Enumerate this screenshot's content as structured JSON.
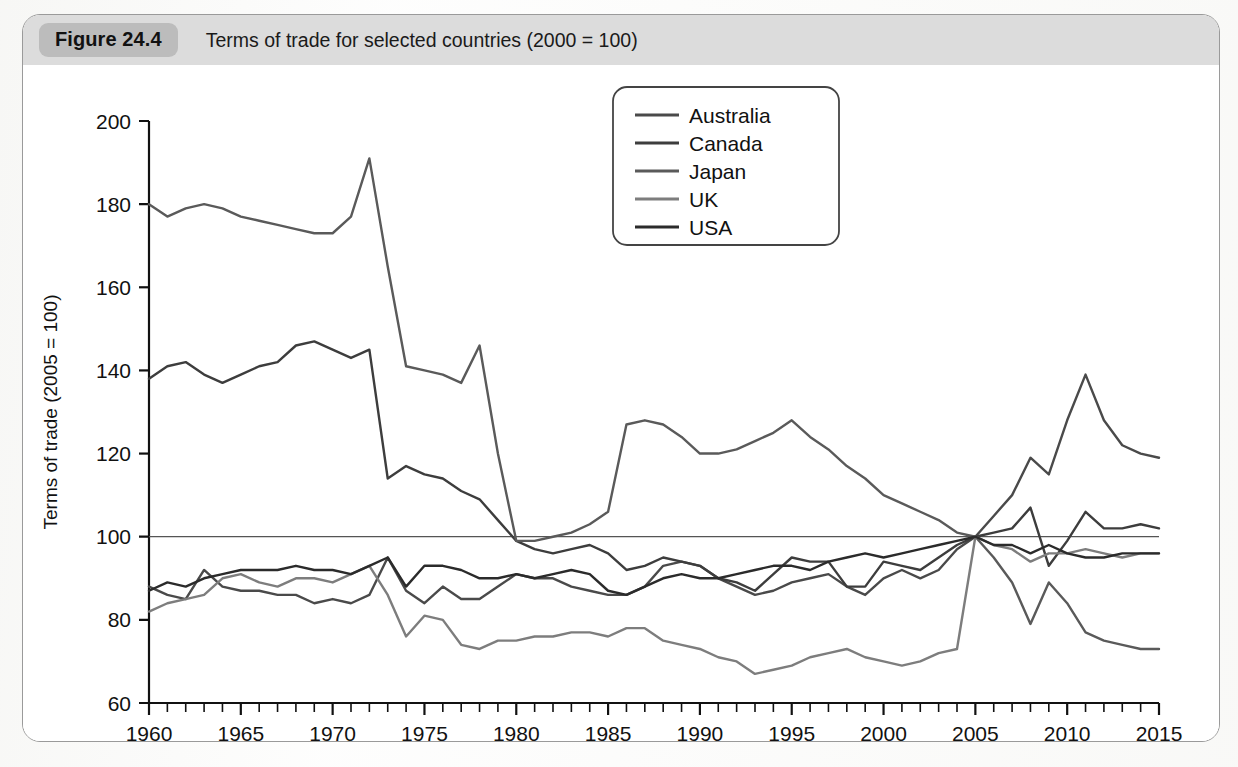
{
  "figure": {
    "badge_label": "Figure 24.4",
    "caption": "Terms of trade for selected countries (2000 = 100)",
    "footnote": ""
  },
  "colors": {
    "header_band": "#dcdcdc",
    "badge": "#bcbcbc",
    "frame_border": "#9a9a9a",
    "axis": "#111111",
    "series_australia": "#4a4a4a",
    "series_canada": "#3d3d3d",
    "series_japan": "#5a5a5a",
    "series_uk": "#7d7d7d",
    "series_usa": "#2b2b2b",
    "reference_line": "#555555"
  },
  "chart_data": {
    "type": "line",
    "title": "Terms of trade for selected countries (2000 = 100)",
    "xlabel": "",
    "ylabel": "Terms of trade (2005 = 100)",
    "xlim": [
      1960,
      2015
    ],
    "ylim": [
      60,
      200
    ],
    "ytick_step": 20,
    "xtick_step": 5,
    "xminor_step": 1,
    "grid": false,
    "legend_position": "top-right",
    "ytick_labels": [
      "60",
      "80",
      "100",
      "120",
      "140",
      "160",
      "180",
      "200"
    ],
    "xtick_labels": [
      "1960",
      "1965",
      "1970",
      "1975",
      "1980",
      "1985",
      "1990",
      "1995",
      "2000",
      "2005",
      "2010",
      "2015"
    ],
    "reference_value": 100,
    "x": [
      1960,
      1961,
      1962,
      1963,
      1964,
      1965,
      1966,
      1967,
      1968,
      1969,
      1970,
      1971,
      1972,
      1973,
      1974,
      1975,
      1976,
      1977,
      1978,
      1979,
      1980,
      1981,
      1982,
      1983,
      1984,
      1985,
      1986,
      1987,
      1988,
      1989,
      1990,
      1991,
      1992,
      1993,
      1994,
      1995,
      1996,
      1997,
      1998,
      1999,
      2000,
      2001,
      2002,
      2003,
      2004,
      2005,
      2006,
      2007,
      2008,
      2009,
      2010,
      2011,
      2012,
      2013,
      2014,
      2015
    ],
    "series": [
      {
        "name": "Australia",
        "values": [
          88,
          86,
          85,
          92,
          88,
          87,
          87,
          86,
          86,
          84,
          85,
          84,
          86,
          95,
          87,
          84,
          88,
          85,
          85,
          88,
          91,
          90,
          90,
          88,
          87,
          86,
          86,
          88,
          93,
          94,
          93,
          90,
          88,
          86,
          87,
          89,
          90,
          91,
          88,
          86,
          90,
          92,
          90,
          92,
          97,
          100,
          105,
          110,
          119,
          115,
          128,
          139,
          128,
          122,
          120,
          119
        ]
      },
      {
        "name": "Canada",
        "values": [
          138,
          141,
          142,
          139,
          137,
          139,
          141,
          142,
          146,
          147,
          145,
          143,
          145,
          114,
          117,
          115,
          114,
          111,
          109,
          104,
          99,
          97,
          96,
          97,
          98,
          96,
          92,
          93,
          95,
          94,
          93,
          90,
          89,
          87,
          91,
          95,
          94,
          94,
          88,
          88,
          94,
          93,
          92,
          95,
          98,
          100,
          101,
          102,
          107,
          93,
          99,
          106,
          102,
          102,
          103,
          102
        ]
      },
      {
        "name": "Japan",
        "values": [
          180,
          177,
          179,
          180,
          179,
          177,
          176,
          175,
          174,
          173,
          173,
          177,
          191,
          165,
          141,
          140,
          139,
          137,
          146,
          120,
          99,
          99,
          100,
          101,
          103,
          106,
          127,
          128,
          127,
          124,
          120,
          120,
          121,
          123,
          125,
          128,
          124,
          121,
          117,
          114,
          110,
          108,
          106,
          104,
          101,
          100,
          95,
          89,
          79,
          89,
          84,
          77,
          75,
          74,
          73,
          73
        ]
      },
      {
        "name": "UK",
        "values": [
          82,
          84,
          85,
          86,
          90,
          91,
          89,
          88,
          90,
          90,
          89,
          91,
          93,
          86,
          76,
          81,
          80,
          74,
          73,
          75,
          75,
          76,
          76,
          77,
          77,
          76,
          78,
          78,
          75,
          74,
          73,
          71,
          70,
          67,
          68,
          69,
          71,
          72,
          73,
          71,
          70,
          69,
          70,
          72,
          73,
          100,
          98,
          97,
          94,
          96,
          96,
          97,
          96,
          95,
          96,
          96
        ]
      },
      {
        "name": "USA",
        "values": [
          87,
          89,
          88,
          90,
          91,
          92,
          92,
          92,
          93,
          92,
          92,
          91,
          93,
          95,
          88,
          93,
          93,
          92,
          90,
          90,
          91,
          90,
          91,
          92,
          91,
          87,
          86,
          88,
          90,
          91,
          90,
          90,
          91,
          92,
          93,
          93,
          92,
          94,
          95,
          96,
          95,
          96,
          97,
          98,
          99,
          100,
          98,
          98,
          96,
          98,
          96,
          95,
          95,
          96,
          96,
          96
        ]
      }
    ]
  },
  "legend": {
    "items": [
      {
        "label": "Australia"
      },
      {
        "label": "Canada"
      },
      {
        "label": "Japan"
      },
      {
        "label": "UK"
      },
      {
        "label": "USA"
      }
    ]
  }
}
